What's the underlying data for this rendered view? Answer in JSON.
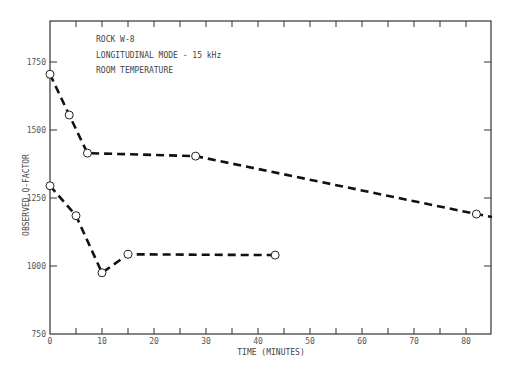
{
  "chart_data": {
    "type": "line",
    "title": "",
    "annotations": [
      "ROCK W-8",
      "LONGITUDINAL MODE - 15 kHz",
      "ROOM TEMPERATURE"
    ],
    "xlabel": "TIME (MINUTES)",
    "ylabel": "OBSERVED Q-FACTOR",
    "xlim": [
      0,
      85
    ],
    "ylim": [
      750,
      1900
    ],
    "xticks": [
      0,
      10,
      20,
      30,
      40,
      50,
      60,
      70,
      80
    ],
    "yticks": [
      750,
      1000,
      1250,
      1500,
      1750
    ],
    "grid": false,
    "legend": null,
    "series": [
      {
        "name": "upper",
        "x": [
          0,
          3.7,
          7.2,
          28,
          82
        ],
        "y": [
          1705,
          1555,
          1415,
          1404,
          1191
        ],
        "extends_to": [
          85,
          1180
        ],
        "style": "dashed",
        "marker": "open-circle"
      },
      {
        "name": "lower",
        "x": [
          0,
          5,
          10,
          15,
          43.3
        ],
        "y": [
          1295,
          1185,
          975,
          1043,
          1040
        ],
        "style": "dashed",
        "marker": "open-circle"
      }
    ]
  },
  "labels": {
    "annot1": "ROCK W-8",
    "annot2": "LONGITUDINAL MODE - 15 kHz",
    "annot3": "ROOM TEMPERATURE",
    "xlabel": "TIME (MINUTES)",
    "ylabel": "OBSERVED Q-FACTOR"
  }
}
